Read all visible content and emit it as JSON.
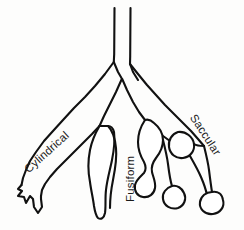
{
  "figure": {
    "background_color": "#fdfdfc",
    "line_color": "#111111",
    "fill_color": "#ffffff",
    "width": 244,
    "height": 230
  },
  "labels": {
    "cylindrical": "Cylindrical",
    "fusiform": "Fusiform",
    "saccular": "Saccular"
  },
  "diagram": {
    "type": "line-art-anatomical",
    "trunk": {
      "description": "vertical parallel-sided airway trunk descending from top and bifurcating",
      "left_wall_x": 114,
      "right_wall_x": 130,
      "top_y": 8,
      "bifurcation_y": 76
    },
    "branches": [
      {
        "name": "cylindrical",
        "side": "left",
        "shape": "uniform parallel-walled tube of constant caliber ending in abrupt squared-off terminal tufts",
        "terminal": "crown of short finger-like spikes"
      },
      {
        "name": "fusiform",
        "side": "center",
        "shape": "spindle-shaped elongated dilatation, widest at mid-segment, tapering at both ends",
        "terminal": "narrow blunt tip"
      },
      {
        "name": "saccular",
        "side": "right",
        "shape": "irregular balloon-like sac outpouchings on narrow stalks",
        "terminal": "rounded bulbous sacs"
      }
    ]
  }
}
